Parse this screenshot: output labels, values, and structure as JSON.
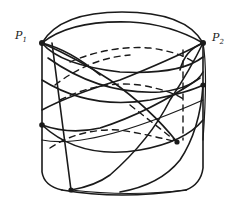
{
  "figure": {
    "type": "cylinder-curves-diagram",
    "labels": {
      "p1": {
        "base": "P",
        "sub": "1"
      },
      "p2": {
        "base": "P",
        "sub": "2"
      }
    },
    "stroke_color": "#1a1a1a",
    "background": "#ffffff",
    "points": [
      {
        "name": "P1",
        "x": 42,
        "y": 43
      },
      {
        "name": "P2",
        "x": 203,
        "y": 43
      },
      {
        "name": "left-mid",
        "x": 42,
        "y": 125
      },
      {
        "name": "right-mid",
        "x": 203,
        "y": 85
      },
      {
        "name": "bottom-front",
        "x": 71,
        "y": 190
      },
      {
        "name": "back-end",
        "x": 177,
        "y": 142
      }
    ]
  }
}
